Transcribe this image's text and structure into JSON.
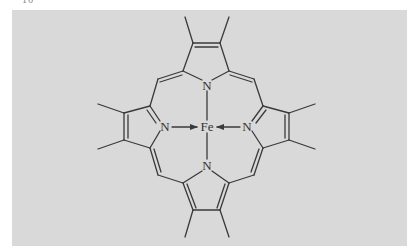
{
  "figure": {
    "caption_fragment": "16",
    "panel_color": "#d9d9d9",
    "line_color": "#3a3a3a"
  },
  "atoms": {
    "center": "Fe",
    "n_top": "N",
    "n_bottom": "N",
    "n_left": "N",
    "n_right": "N"
  },
  "bonds": {
    "coordinate_arrows": [
      "N(left) → Fe",
      "N(right) → Fe"
    ],
    "plain_bonds": [
      "N(top) — Fe",
      "N(bottom) — Fe"
    ]
  }
}
